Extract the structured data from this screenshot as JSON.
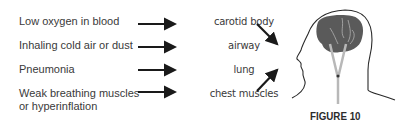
{
  "causes": [
    {
      "label": "Low oxygen in blood",
      "organ": "carotid body"
    },
    {
      "label": "Inhaling cold air or dust",
      "organ": "airway"
    },
    {
      "label": "Pneumonia",
      "organ": "lung"
    },
    {
      "label": "Weak breathing muscles",
      "label2": "or hyperinflation",
      "organ": "chest muscles"
    }
  ],
  "figure_label": "FIGURE 10",
  "colors": {
    "text": "#3a3a3a",
    "brain": "#5a5a5a",
    "arrow": "#1a1a1a",
    "nerve": "#b8b8b8"
  }
}
